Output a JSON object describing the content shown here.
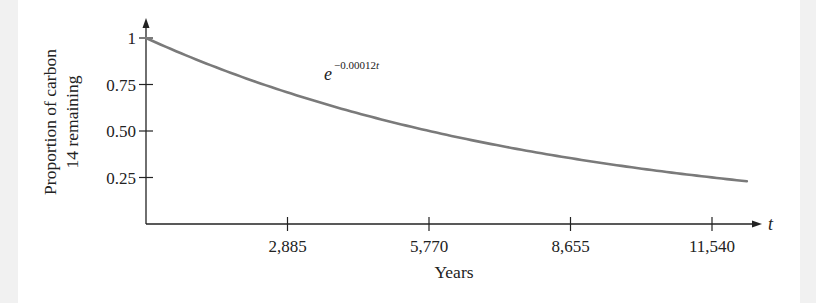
{
  "chart_data": {
    "type": "line",
    "title": "",
    "xlabel": "Years",
    "ylabel": [
      "Proportion of carbon",
      "14 remaining"
    ],
    "x_axis_variable": "t",
    "x_ticks": [
      2885,
      5770,
      8655,
      11540
    ],
    "x_tick_labels": [
      "2,885",
      "5,770",
      "8,655",
      "11,540"
    ],
    "y_ticks": [
      1,
      0.75,
      0.5,
      0.25
    ],
    "y_tick_labels": [
      "1",
      "0.75",
      "0.50",
      "0.25"
    ],
    "xlim": [
      0,
      12250
    ],
    "ylim": [
      0,
      1.1
    ],
    "grid": false,
    "legend": null,
    "annotations": [
      {
        "text": "e^{-0.00012t}",
        "base": "e",
        "exponent_prefix": "−0.00012",
        "exponent_var": "t",
        "position": "above curve near x=3500"
      }
    ],
    "series": [
      {
        "name": "e^(-0.00012t)",
        "function": "exp(-0.00012*t)",
        "color": "#7a7a7a",
        "x": [
          0,
          1000,
          2000,
          2885,
          4000,
          5000,
          5770,
          7000,
          8000,
          8655,
          10000,
          11000,
          11540,
          12250
        ],
        "y": [
          1.0,
          0.887,
          0.787,
          0.707,
          0.619,
          0.549,
          0.5,
          0.432,
          0.383,
          0.354,
          0.301,
          0.267,
          0.25,
          0.23
        ]
      }
    ]
  },
  "colors": {
    "background": "#ffffff",
    "side_margin": "#f1f1f1",
    "axis": "#222222",
    "curve": "#7a7a7a"
  }
}
